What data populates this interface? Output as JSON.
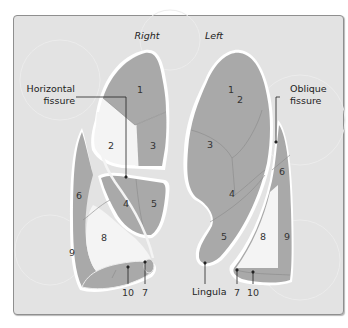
{
  "figure": {
    "side_labels": {
      "right": "Right",
      "left": "Left"
    },
    "callouts": {
      "horizontal_fissure": [
        "Horizontal",
        "fissure"
      ],
      "oblique_fissure": [
        "Oblique",
        "fissure"
      ],
      "lingula": "Lingula"
    },
    "right_lung": {
      "segments": {
        "s1": "1",
        "s2": "2",
        "s3": "3",
        "s4": "4",
        "s5": "5",
        "s6": "6",
        "s7": "7",
        "s8": "8",
        "s9": "9",
        "s10": "10"
      },
      "bottom_labels": {
        "s10": "10",
        "s7": "7"
      }
    },
    "left_lung": {
      "segments": {
        "s1": "1",
        "s2": "2",
        "s3": "3",
        "s4": "4",
        "s5": "5",
        "s6": "6",
        "s8": "8",
        "s9": "9"
      },
      "bottom_labels": {
        "s7": "7",
        "s10": "10"
      }
    },
    "colors": {
      "panel_bg": "#e3e3e3",
      "lobe_fill": "#a9a9a9",
      "lobe_outline": "#ffffff",
      "medial_white": "#f4f4f4",
      "segment_line": "#8a8a8a"
    }
  }
}
